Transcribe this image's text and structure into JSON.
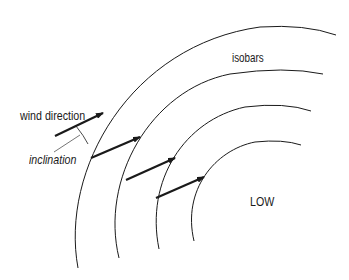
{
  "diagram": {
    "labels": {
      "wind_direction": "wind direction",
      "inclination": "inclination",
      "isobars": "isobars",
      "low": "LOW"
    },
    "colors": {
      "line": "#1a1a1a",
      "background": "#ffffff"
    },
    "isobars": [
      {
        "id": "isobar-1",
        "path": "M 78 268 C 60 170, 130 45, 260 27 Q 305 24, 336 35"
      },
      {
        "id": "isobar-2",
        "path": "M 119 258 C 100 180, 150 90, 230 74 Q 285 66, 323 74"
      },
      {
        "id": "isobar-3",
        "path": "M 159 249 C 145 180, 185 120, 245 107 Q 285 102, 311 111"
      },
      {
        "id": "isobar-4",
        "path": "M 194 241 C 182 190, 215 150, 255 142 Q 283 139, 301 145"
      }
    ],
    "wind_arrows": [
      {
        "id": "arrow-1",
        "x1": 55,
        "y1": 136,
        "x2": 103,
        "y2": 113
      },
      {
        "id": "arrow-2",
        "x1": 91,
        "y1": 158,
        "x2": 140,
        "y2": 137
      },
      {
        "id": "arrow-3",
        "x1": 126,
        "y1": 180,
        "x2": 175,
        "y2": 158
      },
      {
        "id": "arrow-4",
        "x1": 156,
        "y1": 198,
        "x2": 204,
        "y2": 177
      }
    ]
  }
}
